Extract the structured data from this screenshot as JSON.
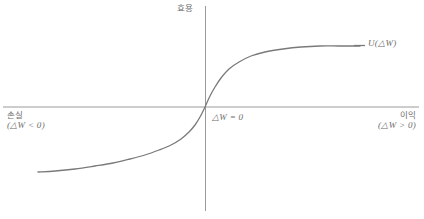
{
  "chart_data": {
    "type": "line",
    "title": "",
    "subtitle": "",
    "xlabel": "",
    "ylabel": "",
    "grid": false,
    "legend_position": "right",
    "axis_origin_label": "△W = 0",
    "xlim": [
      -205,
      219
    ],
    "ylim": [
      -104,
      101
    ],
    "axes": {
      "x_axis_y_px": 107,
      "y_axis_x_px": 205,
      "x_axis_start_px": 3,
      "x_axis_end_px": 419,
      "y_axis_top_px": 6,
      "y_axis_bottom_px": 211
    },
    "series": [
      {
        "name": "U(△W)",
        "comment": "Prospect-theory S-shaped value function, concave for gains and convex for losses",
        "x": [
          -167,
          -150,
          -130,
          -110,
          -92,
          -75,
          -60,
          -46,
          -34,
          -24,
          -16,
          -10,
          -5,
          0,
          5,
          10,
          16,
          24,
          34,
          46,
          60,
          78,
          96,
          115,
          134,
          155
        ],
        "y": [
          -65,
          -64,
          -62,
          -59,
          -56,
          -52,
          -48,
          -43,
          -38,
          -32,
          -25,
          -18,
          -10,
          0,
          11,
          20,
          29,
          38,
          45,
          51,
          55,
          58,
          60,
          61,
          61,
          61
        ]
      }
    ],
    "annotations": [
      {
        "text": "효용",
        "role": "y-axis-title",
        "position": "top-center"
      },
      {
        "text": "손실",
        "role": "x-axis-left-region",
        "position": "left"
      },
      {
        "text": "(△W < 0)",
        "role": "x-axis-left-region-detail",
        "position": "left"
      },
      {
        "text": "△W = 0",
        "role": "origin",
        "position": "center"
      },
      {
        "text": "이익",
        "role": "x-axis-right-region",
        "position": "right"
      },
      {
        "text": "(△W > 0)",
        "role": "x-axis-right-region-detail",
        "position": "right"
      },
      {
        "text": "U(△W)",
        "role": "series-label",
        "position": "right"
      }
    ]
  },
  "labels": {
    "utility": "효용",
    "loss": "손실",
    "loss_condition": "(△W < 0)",
    "origin": "△W = 0",
    "gain": "이익",
    "gain_condition": "(△W > 0)",
    "curve": "U(△W)"
  },
  "colors": {
    "background": "#ffffff",
    "axis": "#9a9a9a",
    "curve": "#7a7a7a",
    "text": "#6d6d6d"
  }
}
